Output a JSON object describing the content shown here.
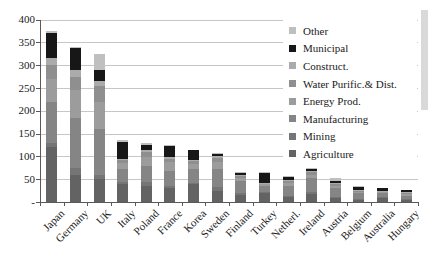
{
  "figure": {
    "width": 428,
    "height": 259,
    "background": "#ffffff"
  },
  "chart_data": {
    "type": "bar",
    "stacked": true,
    "title": "",
    "xlabel": "",
    "ylabel": "",
    "categories": [
      "Japan",
      "Germany",
      "UK",
      "Italy",
      "Poland",
      "France",
      "Korea",
      "Sweden",
      "Finland",
      "Turkey",
      "Netherl.",
      "Ireland",
      "Austria",
      "Belgium",
      "Australia",
      "Hungary"
    ],
    "series": [
      {
        "name": "Agriculture",
        "color": "#636363",
        "values": [
          120,
          60,
          50,
          40,
          35,
          30,
          40,
          25,
          15,
          20,
          12,
          18,
          10,
          6,
          8,
          5
        ]
      },
      {
        "name": "Mining",
        "color": "#757575",
        "values": [
          10,
          15,
          10,
          3,
          8,
          4,
          2,
          8,
          5,
          3,
          2,
          4,
          2,
          1,
          3,
          1
        ]
      },
      {
        "name": "Manufacturing",
        "color": "#858585",
        "values": [
          90,
          110,
          100,
          30,
          35,
          35,
          30,
          40,
          25,
          12,
          20,
          30,
          18,
          12,
          8,
          8
        ]
      },
      {
        "name": "Energy Prod.",
        "color": "#9c9c9c",
        "values": [
          50,
          60,
          60,
          12,
          20,
          18,
          12,
          15,
          8,
          4,
          8,
          8,
          6,
          4,
          3,
          4
        ]
      },
      {
        "name": "Water Purific.& Dist.",
        "color": "#8f8f8f",
        "values": [
          30,
          30,
          35,
          8,
          12,
          8,
          6,
          8,
          5,
          2,
          4,
          5,
          4,
          2,
          2,
          2
        ]
      },
      {
        "name": "Construct.",
        "color": "#ababab",
        "values": [
          15,
          15,
          10,
          2,
          4,
          3,
          3,
          5,
          2,
          1,
          2,
          3,
          2,
          1,
          1,
          1
        ]
      },
      {
        "name": "Municipal",
        "color": "#171717",
        "values": [
          55,
          48,
          25,
          36,
          12,
          25,
          22,
          6,
          4,
          22,
          9,
          5,
          3,
          7,
          5,
          5
        ]
      },
      {
        "name": "Other",
        "color": "#bfbfbf",
        "values": [
          5,
          2,
          35,
          6,
          4,
          1,
          0,
          1,
          1,
          2,
          1,
          1,
          8,
          1,
          0,
          0
        ]
      }
    ],
    "totals": [
      375,
      340,
      325,
      137,
      130,
      124,
      115,
      108,
      65,
      66,
      58,
      74,
      53,
      34,
      30,
      26
    ],
    "y_axis": {
      "min": 0,
      "max": 400,
      "tick_interval": 50,
      "tick_labels_top_to_bottom": [
        "400",
        "350",
        "300",
        "250",
        "200",
        "150",
        "100",
        "50",
        "-"
      ],
      "zero_rendered_as": "-",
      "gridlines": true
    },
    "x_axis": {
      "label_rotation_deg": 45
    },
    "legend": {
      "position": "center-right-overlay",
      "entries_top_to_bottom": [
        "Other",
        "Municipal",
        "Construct.",
        "Water Purific.& Dist.",
        "Energy Prod.",
        "Manufacturing",
        "Mining",
        "Agriculture"
      ]
    }
  }
}
